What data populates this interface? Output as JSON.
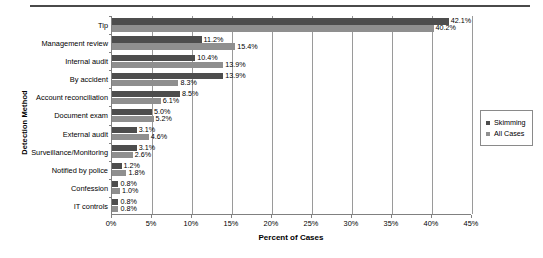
{
  "chart_data": {
    "type": "bar",
    "orientation": "horizontal",
    "title": "",
    "xlabel": "Percent of Cases",
    "ylabel": "Detection Method",
    "xlim": [
      0,
      45
    ],
    "xticks": [
      "0%",
      "5%",
      "10%",
      "15%",
      "20%",
      "25%",
      "30%",
      "35%",
      "40%",
      "45%"
    ],
    "xtick_values": [
      0,
      5,
      10,
      15,
      20,
      25,
      30,
      35,
      40,
      45
    ],
    "grid": true,
    "legend_position": "right",
    "categories": [
      "Tip",
      "Management review",
      "Internal audit",
      "By accident",
      "Account reconciliation",
      "Document exam",
      "External audit",
      "Surveillance/Monitoring",
      "Notified by police",
      "Confession",
      "IT controls"
    ],
    "series": [
      {
        "name": "Skimming",
        "color": "#4d4d4d",
        "values": [
          42.1,
          11.2,
          10.4,
          13.9,
          8.5,
          5.0,
          3.1,
          3.1,
          1.2,
          0.8,
          0.8
        ],
        "labels": [
          "42.1%",
          "11.2%",
          "10.4%",
          "13.9%",
          "8.5%",
          "5.0%",
          "3.1%",
          "3.1%",
          "1.2%",
          "0.8%",
          "0.8%"
        ]
      },
      {
        "name": "All Cases",
        "color": "#8f8f8f",
        "values": [
          40.2,
          15.4,
          13.9,
          8.3,
          6.1,
          5.2,
          4.6,
          2.6,
          1.8,
          1.0,
          0.8
        ],
        "labels": [
          "40.2%",
          "15.4%",
          "13.9%",
          "8.3%",
          "6.1%",
          "5.2%",
          "4.6%",
          "2.6%",
          "1.8%",
          "1.0%",
          "0.8%"
        ]
      }
    ]
  },
  "legend": {
    "items": [
      {
        "label": "Skimming",
        "color": "#4d4d4d"
      },
      {
        "label": "All Cases",
        "color": "#8f8f8f"
      }
    ]
  },
  "axes": {
    "x_title": "Percent of Cases",
    "y_title": "Detection Method"
  }
}
